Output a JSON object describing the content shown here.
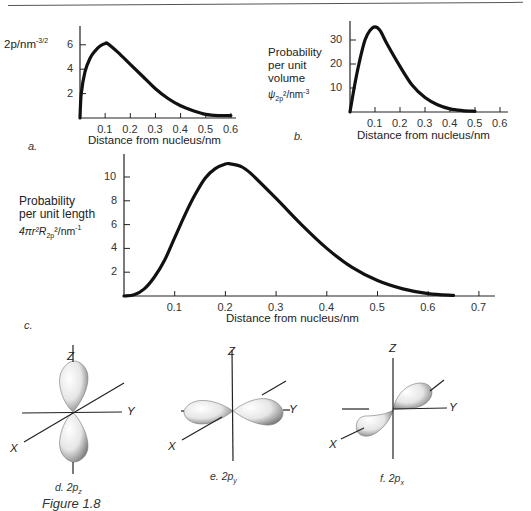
{
  "figure": {
    "caption": "Figure 1.8"
  },
  "chart_data": [
    {
      "id": "a",
      "type": "line",
      "panel_label": "a.",
      "title": "",
      "xlabel": "Distance from nucleus/nm",
      "ylabel": "2p/nm^-3/2",
      "ylabel_parts": {
        "main": "2p/nm",
        "sup": "-3/2"
      },
      "x_ticks": [
        "0.1",
        "0.2",
        "0.3",
        "0.4",
        "0.5",
        "0.6"
      ],
      "y_ticks": [
        "2",
        "4",
        "6"
      ],
      "xlim": [
        0,
        0.65
      ],
      "ylim": [
        0,
        7
      ],
      "grid": false,
      "x": [
        0.0,
        0.005,
        0.02,
        0.04,
        0.06,
        0.08,
        0.1,
        0.11,
        0.15,
        0.2,
        0.25,
        0.3,
        0.35,
        0.4,
        0.45,
        0.5,
        0.55,
        0.6
      ],
      "y": [
        0.0,
        2.0,
        3.8,
        4.9,
        5.5,
        5.9,
        6.1,
        6.1,
        5.4,
        4.4,
        3.4,
        2.4,
        1.6,
        1.0,
        0.6,
        0.3,
        0.2,
        0.2
      ]
    },
    {
      "id": "b",
      "type": "line",
      "panel_label": "b.",
      "title": "",
      "xlabel": "Distance from nucleus/nm",
      "ylabel": "Probability per unit volume ψ2p²/nm^-3",
      "ylabel_lines": [
        "Probability",
        "per unit",
        "volume"
      ],
      "ylabel_formula": {
        "main": "ψ",
        "sub": "2p",
        "rest": "²/nm",
        "sup": "-3"
      },
      "x_ticks": [
        "0.1",
        "0.2",
        "0.3",
        "0.4",
        "0.5",
        "0.6"
      ],
      "y_ticks": [
        "10",
        "20",
        "30"
      ],
      "xlim": [
        0,
        0.65
      ],
      "ylim": [
        0,
        38
      ],
      "grid": false,
      "x": [
        0.0,
        0.02,
        0.04,
        0.06,
        0.08,
        0.1,
        0.12,
        0.15,
        0.2,
        0.25,
        0.3,
        0.35,
        0.4,
        0.45,
        0.5
      ],
      "y": [
        0.0,
        12,
        22,
        30,
        34,
        35.5,
        34,
        28,
        19,
        11,
        6,
        3,
        1.3,
        0.6,
        0.3
      ]
    },
    {
      "id": "c",
      "type": "line",
      "panel_label": "c.",
      "title": "",
      "xlabel": "Distance from nucleus/nm",
      "ylabel": "Probability per unit length 4πr²R2p²/nm^-1",
      "ylabel_lines": [
        "Probability",
        "per unit length"
      ],
      "ylabel_formula": {
        "main": "4πr²R",
        "sub": "2p",
        "rest": "²/nm",
        "sup": "-1"
      },
      "x_ticks": [
        "0.1",
        "0.2",
        "0.3",
        "0.4",
        "0.5",
        "0.6",
        "0.7"
      ],
      "y_ticks": [
        "2",
        "4",
        "6",
        "8",
        "10"
      ],
      "xlim": [
        0,
        0.75
      ],
      "ylim": [
        0,
        11.5
      ],
      "grid": false,
      "x": [
        0.0,
        0.02,
        0.04,
        0.06,
        0.08,
        0.1,
        0.12,
        0.14,
        0.16,
        0.18,
        0.2,
        0.21,
        0.23,
        0.25,
        0.3,
        0.35,
        0.4,
        0.45,
        0.5,
        0.55,
        0.6,
        0.65
      ],
      "y": [
        0.0,
        0.1,
        0.6,
        1.6,
        3.0,
        4.9,
        6.8,
        8.5,
        9.9,
        10.7,
        11.1,
        11.1,
        10.9,
        10.3,
        8.2,
        6.0,
        4.0,
        2.4,
        1.3,
        0.6,
        0.2,
        0.05
      ]
    }
  ],
  "orbitals": [
    {
      "id": "d",
      "label_prefix": "d. 2p",
      "label_sub": "z",
      "axes": {
        "z": "Z",
        "y": "Y",
        "x": "X"
      },
      "orientation": "z"
    },
    {
      "id": "e",
      "label_prefix": "e. 2p",
      "label_sub": "y",
      "axes": {
        "z": "Z",
        "y": "Y",
        "x": "X"
      },
      "orientation": "y"
    },
    {
      "id": "f",
      "label_prefix": "f. 2p",
      "label_sub": "x",
      "axes": {
        "z": "Z",
        "y": "Y",
        "x": "X"
      },
      "orientation": "x"
    }
  ]
}
